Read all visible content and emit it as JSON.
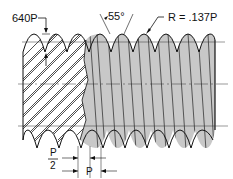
{
  "diagram": {
    "labels": {
      "truncation": "640P",
      "angle": "55°",
      "radius": "R = .137P",
      "half_pitch_num": "P",
      "half_pitch_den": "2",
      "pitch": "P"
    },
    "colors": {
      "line": "#111111",
      "shaded": "#c8c8c8",
      "background": "#ffffff"
    }
  }
}
